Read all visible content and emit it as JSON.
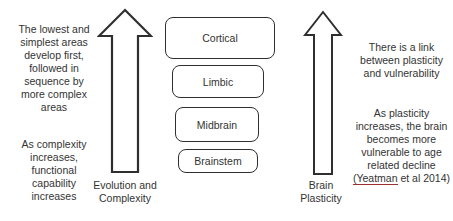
{
  "diagram": {
    "left_text": {
      "para1": "The lowest and\nsimplest areas\ndevelop first,\nfollowed in\nsequence by\nmore complex\nareas",
      "para2": "As complexity\nincreases,\nfunctional\ncapability\nincreases"
    },
    "left_arrow_label": "Evolution and\nComplexity",
    "boxes": [
      {
        "label": "Cortical"
      },
      {
        "label": "Limbic"
      },
      {
        "label": "Midbrain"
      },
      {
        "label": "Brainstem"
      }
    ],
    "right_arrow_label": "Brain\nPlasticity",
    "right_text": {
      "para1": "There is a link\nbetween plasticity\nand vulnerability",
      "para2_main": "As plasticity\nincreases, the brain\nbecomes more\nvulnerable to age\nrelated decline\n",
      "citation_underlined": "(Yeatman",
      "citation_rest": " et al 2014)"
    },
    "colors": {
      "ink": "#333333",
      "outline": "#2f2f2f",
      "citation_underline": "#9c2f2f",
      "background": "#ffffff"
    }
  }
}
